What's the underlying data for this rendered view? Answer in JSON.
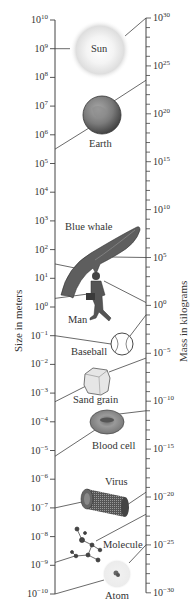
{
  "figure": {
    "left_axis_title": "Size in meters",
    "right_axis_title": "Mass in kilograms",
    "left_axis": {
      "base": "10",
      "exponents": [
        10,
        9,
        8,
        7,
        6,
        5,
        4,
        3,
        2,
        1,
        0,
        -1,
        -2,
        -3,
        -4,
        -5,
        -6,
        -7,
        -8,
        -9,
        -10
      ]
    },
    "right_axis": {
      "base": "10",
      "labeled_exponents": [
        30,
        25,
        20,
        15,
        10,
        5,
        0,
        -5,
        -10,
        -15,
        -20,
        -25,
        -30
      ],
      "minor_step": 1
    },
    "objects": [
      {
        "name": "Sun",
        "size_exp": 9,
        "mass_exp": 30
      },
      {
        "name": "Earth",
        "size_exp": 7,
        "mass_exp": 24
      },
      {
        "name": "Blue whale",
        "size_exp": 1.5,
        "mass_exp": 5
      },
      {
        "name": "Man",
        "size_exp": 0.3,
        "mass_exp": 2
      },
      {
        "name": "Baseball",
        "size_exp": -1,
        "mass_exp": -1
      },
      {
        "name": "Sand grain",
        "size_exp": -3.3,
        "mass_exp": -6
      },
      {
        "name": "Blood cell",
        "size_exp": -5.2,
        "mass_exp": -11
      },
      {
        "name": "Virus",
        "size_exp": -7,
        "mass_exp": -19.5
      },
      {
        "name": "Molecule",
        "size_exp": -9,
        "mass_exp": -25
      },
      {
        "name": "Atom",
        "size_exp": -10,
        "mass_exp": -26
      }
    ]
  },
  "colors": {
    "ink": "#333333",
    "line": "#444444",
    "sun_glow": "#d8d8d8",
    "earth": "#7a7a7a",
    "whale": "#5e5e5e",
    "blood": "#8a8a8a"
  }
}
